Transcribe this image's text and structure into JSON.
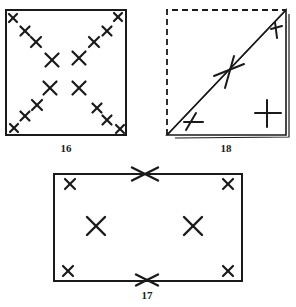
{
  "figures": [
    {
      "id": "fig16",
      "label": "16",
      "description": "Square with X marks along both diagonals",
      "box": {
        "x": 6,
        "y": 10,
        "w": 120,
        "h": 125
      },
      "marks": [
        {
          "x": 13,
          "y": 18,
          "s": 4
        },
        {
          "x": 25,
          "y": 31,
          "s": 4.5
        },
        {
          "x": 36,
          "y": 42,
          "s": 5
        },
        {
          "x": 52,
          "y": 60,
          "s": 6.5
        },
        {
          "x": 79,
          "y": 58,
          "s": 6.5
        },
        {
          "x": 94,
          "y": 42,
          "s": 5
        },
        {
          "x": 107,
          "y": 31,
          "s": 4.5
        },
        {
          "x": 118,
          "y": 17,
          "s": 4
        },
        {
          "x": 50,
          "y": 88,
          "s": 6.5
        },
        {
          "x": 79,
          "y": 88,
          "s": 6.5
        },
        {
          "x": 37,
          "y": 105,
          "s": 5
        },
        {
          "x": 25,
          "y": 116,
          "s": 4.5
        },
        {
          "x": 14,
          "y": 128,
          "s": 4
        },
        {
          "x": 97,
          "y": 108,
          "s": 4.5
        },
        {
          "x": 107,
          "y": 120,
          "s": 4.5
        },
        {
          "x": 120,
          "y": 129,
          "s": 4
        }
      ],
      "label_pos": {
        "x": 66,
        "y": 150
      }
    },
    {
      "id": "fig18",
      "label": "18",
      "description": "Square folded along diagonal; dashed upper-left triangle, solid lower-right triangle",
      "box": {
        "x": 167,
        "y": 10,
        "w": 119,
        "h": 125
      },
      "label_pos": {
        "x": 226,
        "y": 150
      }
    },
    {
      "id": "fig17",
      "label": "17",
      "description": "Rectangle with X marks at corners, interior and mid-edges",
      "box": {
        "x": 54,
        "y": 174,
        "w": 188,
        "h": 107
      },
      "marks": [
        {
          "x": 70,
          "y": 184,
          "s": 5
        },
        {
          "x": 228,
          "y": 184,
          "s": 5
        },
        {
          "x": 96,
          "y": 226,
          "s": 9
        },
        {
          "x": 193,
          "y": 226,
          "s": 9
        },
        {
          "x": 68,
          "y": 271,
          "s": 5
        },
        {
          "x": 228,
          "y": 271,
          "s": 5
        },
        {
          "x": 145,
          "y": 174,
          "s": 13,
          "flat": true
        },
        {
          "x": 147,
          "y": 280,
          "s": 11,
          "flat": true
        }
      ],
      "label_pos": {
        "x": 147,
        "y": 296
      }
    }
  ],
  "colors": {
    "ink": "#1a1a1a",
    "paper": "#ffffff"
  }
}
